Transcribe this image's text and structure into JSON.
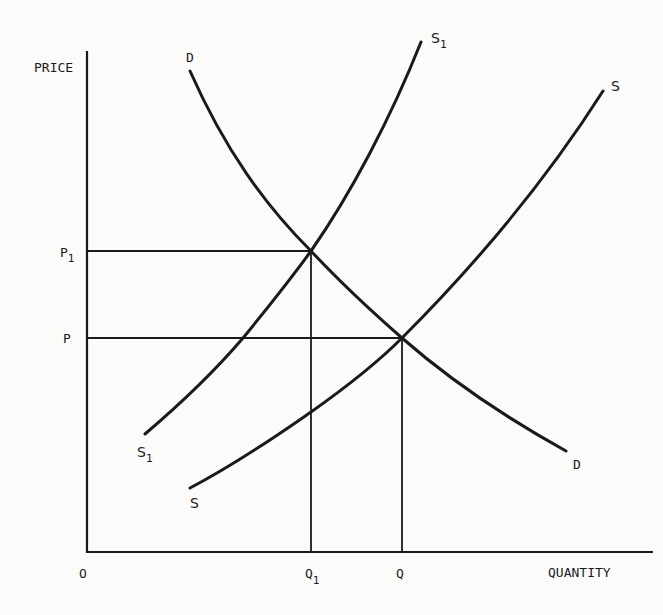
{
  "diagram": {
    "type": "supply-demand",
    "axes": {
      "y_label": "PRICE",
      "x_label": "QUANTITY",
      "origin_label": "O"
    },
    "price_labels": {
      "p1": {
        "base": "P",
        "sub": "1"
      },
      "p": {
        "base": "P",
        "sub": ""
      }
    },
    "quantity_labels": {
      "q1": {
        "base": "Q",
        "sub": "1"
      },
      "q": {
        "base": "Q",
        "sub": ""
      }
    },
    "curves": {
      "demand": {
        "top_label": "D",
        "bottom_label": "D"
      },
      "supply": {
        "top_label": "S",
        "bottom_label": "S"
      },
      "supply_shifted": {
        "top_label_base": "S",
        "top_label_sub": "1",
        "bottom_label_base": "S",
        "bottom_label_sub": "1"
      }
    },
    "equilibria": [
      {
        "name": "original",
        "price": "P",
        "quantity": "Q",
        "curves": [
          "D",
          "S"
        ]
      },
      {
        "name": "shifted",
        "price": "P1",
        "quantity": "Q1",
        "curves": [
          "D",
          "S1"
        ]
      }
    ],
    "colors": {
      "ink": "#1a1a1a",
      "paper": "#fbfbfa"
    }
  }
}
